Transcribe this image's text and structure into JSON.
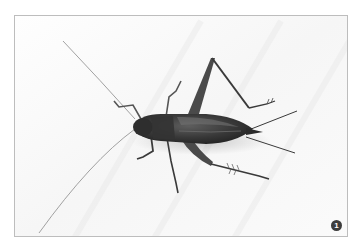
{
  "figure": {
    "background_color": "#ffffff",
    "frame_color": "#bdbdbd",
    "badge": {
      "label": "1",
      "color": "#3d3d3d",
      "text_color": "#ffffff"
    }
  }
}
